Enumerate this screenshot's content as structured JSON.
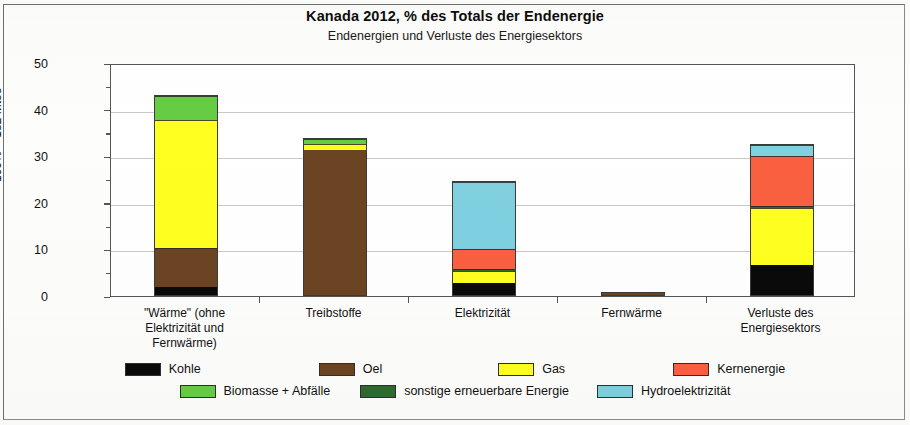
{
  "chart_data": {
    "type": "bar",
    "subtype": "stacked-bar",
    "title": "Kanada  2012,  % des Totals der Endenergie",
    "subtitle": "Endenergien und Verluste des Energiesektors",
    "xlabel": "",
    "ylabel": "100% = 182 Mtoe",
    "ylim": [
      0,
      50
    ],
    "yticks": [
      0,
      10,
      20,
      30,
      40,
      50
    ],
    "ytick_labels": [
      "0",
      "10",
      "20",
      "30",
      "40",
      "50"
    ],
    "yminor_ticks": [
      5,
      15,
      25,
      35,
      45
    ],
    "grid": "horizontal",
    "legend_position": "bottom",
    "categories": [
      "\"Wärme\" (ohne Elektrizität und Fernwärme)",
      "Treibstoffe",
      "Elektrizität",
      "Fernwärme",
      "Verluste des Energiesektors"
    ],
    "category_lines": [
      [
        "\"Wärme\" (ohne",
        "Elektrizität und",
        "Fernwärme)"
      ],
      [
        "Treibstoffe"
      ],
      [
        "Elektrizität"
      ],
      [
        "Fernwärme"
      ],
      [
        "Verluste des",
        "Energiesektors"
      ]
    ],
    "series": [
      {
        "name": "Kohle",
        "color": "#0a0a0a",
        "values": [
          1.8,
          0.0,
          2.6,
          0.0,
          6.5
        ]
      },
      {
        "name": "Oel",
        "color": "#6b4423",
        "values": [
          8.2,
          31.2,
          0.0,
          0.4,
          0.0
        ]
      },
      {
        "name": "Gas",
        "color": "#ffff20",
        "values": [
          27.5,
          1.3,
          2.6,
          0.0,
          12.2
        ]
      },
      {
        "name": "Kernenergie",
        "color": "#fa6040",
        "values": [
          0.0,
          0.0,
          4.2,
          0.0,
          10.7
        ]
      },
      {
        "name": "Biomasse + Abfälle",
        "color": "#66cc44",
        "values": [
          5.3,
          1.0,
          0.0,
          0.0,
          0.0
        ]
      },
      {
        "name": "sonstige erneuerbare Energie",
        "color": "#2e6b2e",
        "values": [
          0.0,
          0.0,
          0.4,
          0.0,
          0.5
        ]
      },
      {
        "name": "Hydroelektrizität",
        "color": "#7fd0e0",
        "values": [
          0.0,
          0.0,
          14.4,
          0.0,
          2.3
        ]
      }
    ],
    "stack_order": [
      "Kohle",
      "Oel",
      "Gas",
      "sonstige erneuerbare Energie",
      "Kernenergie",
      "Hydroelektrizität",
      "Biomasse + Abfälle"
    ],
    "totals": [
      42.8,
      33.5,
      24.2,
      0.4,
      32.2
    ]
  },
  "legend": {
    "rows": [
      [
        "Kohle",
        "Oel",
        "Gas",
        "Kernenergie"
      ],
      [
        "Biomasse + Abfälle",
        "sonstige erneuerbare Energie",
        "Hydroelektrizität"
      ]
    ]
  }
}
